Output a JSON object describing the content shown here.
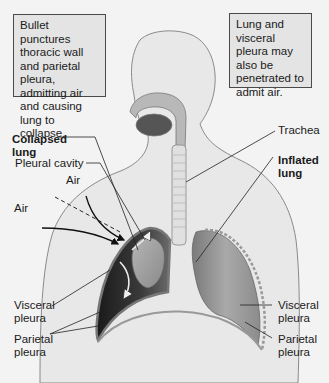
{
  "figure": {
    "colors": {
      "background": "#f3f3f3",
      "body_fill": "#e8e8e8",
      "outline": "#8a8a8a",
      "lung_inflated": "#9c9c9c",
      "lung_collapsed": "#8f8f8f",
      "pleural_cavity_dark": "#2a2a2a",
      "callout_fill": "#e4e4e4",
      "callout_border": "#4a4a4a"
    }
  },
  "callouts": {
    "left": "Bullet punctures thoracic wall and parietal pleura, admitting air and causing lung to collapse.",
    "right": "Lung and visceral pleura may also be penetrated to admit air."
  },
  "labels": {
    "pleural_cavity": "Pleural cavity",
    "collapsed_lung": "Collapsed\nlung",
    "air_upper": "Air",
    "air_lower": "Air",
    "trachea": "Trachea",
    "inflated_lung": "Inflated\nlung",
    "visceral_pleura_left": "Visceral\npleura",
    "parietal_pleura_left": "Parietal\npleura",
    "visceral_pleura_right": "Visceral\npleura",
    "parietal_pleura_right": "Parietal\npleura"
  }
}
